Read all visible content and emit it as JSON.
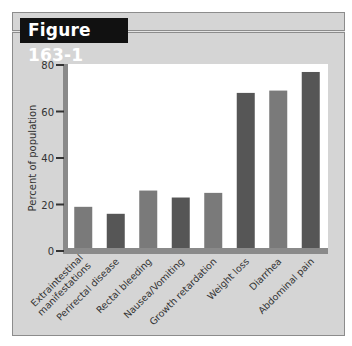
{
  "figure_label": "Figure 163-1",
  "colors": {
    "frame_bg": "#d5d5d5",
    "plot_bg": "#ffffff",
    "axis": "#8a8a8a",
    "bar_medium": "#7a7a7a",
    "bar_dark": "#565656"
  },
  "chart_data": {
    "type": "bar",
    "title": "",
    "xlabel": "",
    "ylabel": "Percent of population",
    "ylim": [
      0,
      80
    ],
    "yticks": [
      0,
      20,
      40,
      60,
      80
    ],
    "grid": false,
    "categories": [
      [
        "Extraintestinal",
        "manifestations"
      ],
      [
        "Perirectal disease"
      ],
      [
        "Rectal bleeding"
      ],
      [
        "Nausea/Vomiting"
      ],
      [
        "Growth retardation"
      ],
      [
        "Weight loss"
      ],
      [
        "Diarrhea"
      ],
      [
        "Abdominal pain"
      ]
    ],
    "values": [
      19,
      16,
      26,
      23,
      25,
      68,
      69,
      77
    ],
    "bar_shades": [
      "medium",
      "dark",
      "medium",
      "dark",
      "medium",
      "dark",
      "medium",
      "dark"
    ]
  }
}
